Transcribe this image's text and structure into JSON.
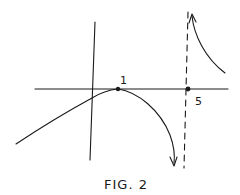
{
  "figure": {
    "caption": "FIG. 2",
    "labels": {
      "point_a": "1",
      "point_b": "5"
    },
    "elements": {
      "x_axis": "horizontal axis",
      "y_axis": "vertical axis",
      "asymptote": "vertical dashed asymptote at x = 5",
      "left_branch": "curve rising to touch axis at x = 1 then falling to -infinity",
      "right_branch": "curve descending from +infinity right of asymptote"
    },
    "ink_color": "#1a1a1a"
  }
}
